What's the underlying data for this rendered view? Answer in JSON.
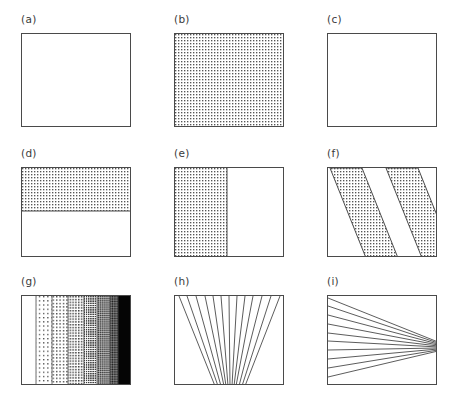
{
  "figure": {
    "width": 463,
    "height": 408,
    "background_color": "#ffffff",
    "line_color": "#4a4a4a",
    "stipple_color": "#555555",
    "label_color": "#3a3a3a",
    "columns": 3,
    "rows": 3
  },
  "panels": [
    {
      "id": "a",
      "label": "(a)",
      "description": "empty rectangle, no fill",
      "box": {
        "x": 21,
        "y": 33,
        "width": 110,
        "height": 94
      },
      "label_pos": {
        "x": 21,
        "y": 19
      },
      "fill": "none",
      "regions": []
    },
    {
      "id": "b",
      "label": "(b)",
      "description": "rectangle fully filled with fine dot stipple",
      "box": {
        "x": 174,
        "y": 33,
        "width": 110,
        "height": 94
      },
      "label_pos": {
        "x": 174,
        "y": 19
      },
      "fill": "stipple-medium",
      "regions": [
        {
          "shape": "rect",
          "x": 0,
          "y": 0,
          "width": 110,
          "height": 94,
          "density": "medium"
        }
      ]
    },
    {
      "id": "c",
      "label": "(c)",
      "description": "empty rectangle, no fill",
      "box": {
        "x": 327,
        "y": 33,
        "width": 110,
        "height": 94
      },
      "label_pos": {
        "x": 327,
        "y": 19
      },
      "fill": "none",
      "regions": []
    },
    {
      "id": "d",
      "label": "(d)",
      "description": "upper horizontal half filled with dot stipple, lower half empty, divided by a horizontal line",
      "box": {
        "x": 21,
        "y": 167,
        "width": 110,
        "height": 90
      },
      "label_pos": {
        "x": 21,
        "y": 153
      },
      "fill": "stipple-medium",
      "split": "horizontal",
      "split_fraction": 0.48,
      "regions": [
        {
          "shape": "rect",
          "x": 0,
          "y": 0,
          "width": 110,
          "height": 43,
          "density": "medium"
        }
      ]
    },
    {
      "id": "e",
      "label": "(e)",
      "description": "left vertical portion filled with dot stipple, right portion empty, divided by a vertical line",
      "box": {
        "x": 174,
        "y": 167,
        "width": 110,
        "height": 90
      },
      "label_pos": {
        "x": 174,
        "y": 153
      },
      "fill": "stipple-medium",
      "split": "vertical",
      "split_fraction": 0.47,
      "regions": [
        {
          "shape": "rect",
          "x": 0,
          "y": 0,
          "width": 52,
          "height": 90,
          "density": "medium"
        }
      ]
    },
    {
      "id": "f",
      "label": "(f)",
      "description": "two slanted parallel bands filled with dot stipple running from upper-left to lower-right",
      "box": {
        "x": 327,
        "y": 167,
        "width": 110,
        "height": 90
      },
      "label_pos": {
        "x": 327,
        "y": 153
      },
      "fill": "stipple-medium",
      "bands": [
        {
          "top_left": 2,
          "top_right": 34,
          "bottom_left": 38,
          "bottom_right": 70
        },
        {
          "top_left": 58,
          "top_right": 90,
          "bottom_left": 94,
          "bottom_right": 126
        }
      ]
    },
    {
      "id": "g",
      "label": "(g)",
      "description": "seven vertical bands of increasing dot density from white through grays to solid black, with white margins at both ends",
      "box": {
        "x": 21,
        "y": 295,
        "width": 110,
        "height": 90
      },
      "label_pos": {
        "x": 21,
        "y": 281
      },
      "fill": "density-ramp",
      "bands": [
        {
          "index": 0,
          "x": 0,
          "width": 14,
          "density_pct": 0,
          "tone": "white"
        },
        {
          "index": 1,
          "x": 14,
          "width": 16,
          "density_pct": 12,
          "tone": "very-light-stipple"
        },
        {
          "index": 2,
          "x": 30,
          "width": 16,
          "density_pct": 22,
          "tone": "light-stipple"
        },
        {
          "index": 3,
          "x": 46,
          "width": 16,
          "density_pct": 35,
          "tone": "medium-stipple"
        },
        {
          "index": 4,
          "x": 62,
          "width": 13,
          "density_pct": 55,
          "tone": "dense-stipple"
        },
        {
          "index": 5,
          "x": 75,
          "width": 13,
          "density_pct": 72,
          "tone": "dark-gray"
        },
        {
          "index": 6,
          "x": 88,
          "width": 8,
          "density_pct": 88,
          "tone": "very-dark-gray"
        },
        {
          "index": 7,
          "x": 96,
          "width": 14,
          "density_pct": 100,
          "tone": "solid-black"
        }
      ]
    },
    {
      "id": "h",
      "label": "(h)",
      "description": "fan of straight lines spreading from a convergence point at the bottom-center up to the top edge",
      "box": {
        "x": 174,
        "y": 295,
        "width": 110,
        "height": 90
      },
      "label_pos": {
        "x": 174,
        "y": 281
      },
      "fill": "line-fan",
      "apex": {
        "x": 55,
        "y": 90
      },
      "line_count": 13,
      "top_x_positions": [
        4,
        12,
        21,
        30,
        38,
        46,
        54,
        62,
        70,
        78,
        87,
        96,
        105
      ],
      "apex_x_positions": [
        40,
        43,
        46,
        49,
        51,
        53,
        55,
        57,
        59,
        61,
        64,
        67,
        70
      ]
    },
    {
      "id": "i",
      "label": "(i)",
      "description": "fan of straight lines converging at a point on the right edge, radiating to evenly spaced points along the left edge",
      "box": {
        "x": 327,
        "y": 295,
        "width": 110,
        "height": 90
      },
      "label_pos": {
        "x": 327,
        "y": 281
      },
      "fill": "line-fan",
      "apex": {
        "x": 109,
        "y": 51
      },
      "line_count": 10,
      "left_y_positions": [
        2,
        10,
        19,
        28,
        37,
        45,
        54,
        63,
        72,
        81
      ]
    }
  ]
}
